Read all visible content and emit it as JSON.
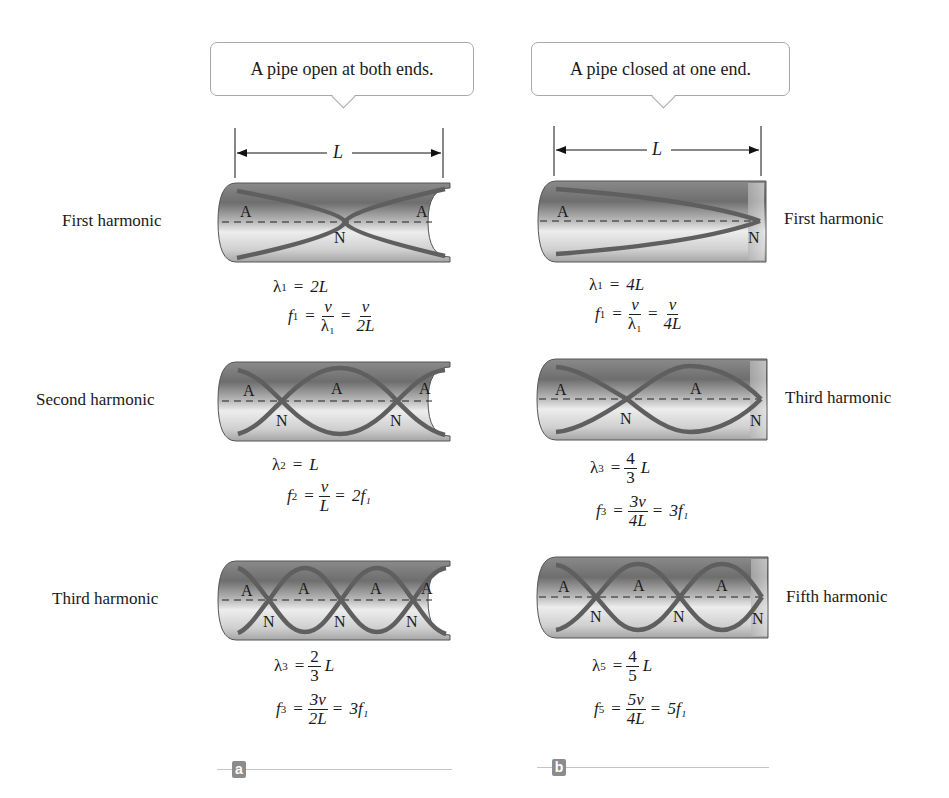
{
  "panels": [
    {
      "id": "a",
      "callout": "A pipe open at both ends.",
      "length_label": "L",
      "tag": "a",
      "harmonics": [
        {
          "label": "First harmonic",
          "wavelength": {
            "sym": "λ",
            "n": "1",
            "rhs": "2L"
          },
          "freq": {
            "sym": "f",
            "n": "1",
            "mid_num": "v",
            "mid_den": "λ₁",
            "rhs_num": "v",
            "rhs_den": "2L"
          },
          "nodes": [
            "A",
            "N",
            "A"
          ]
        },
        {
          "label": "Second harmonic",
          "wavelength": {
            "sym": "λ",
            "n": "2",
            "rhs": "L"
          },
          "freq": {
            "sym": "f",
            "n": "2",
            "mid_num": "v",
            "mid_den": "L",
            "rhs": "2f₁"
          },
          "nodes": [
            "A",
            "N",
            "A",
            "N",
            "A"
          ]
        },
        {
          "label": "Third harmonic",
          "wavelength": {
            "sym": "λ",
            "n": "3",
            "frac_num": "2",
            "frac_den": "3",
            "rhs": "L"
          },
          "freq": {
            "sym": "f",
            "n": "3",
            "mid_num": "3v",
            "mid_den": "2L",
            "rhs": "3f₁"
          },
          "nodes": [
            "A",
            "N",
            "A",
            "N",
            "A",
            "N",
            "A"
          ]
        }
      ]
    },
    {
      "id": "b",
      "callout": "A pipe closed at one end.",
      "length_label": "L",
      "tag": "b",
      "harmonics": [
        {
          "label": "First harmonic",
          "wavelength": {
            "sym": "λ",
            "n": "1",
            "rhs": "4L"
          },
          "freq": {
            "sym": "f",
            "n": "1",
            "mid_num": "v",
            "mid_den": "λ₁",
            "rhs_num": "v",
            "rhs_den": "4L"
          },
          "nodes": [
            "A",
            "N"
          ]
        },
        {
          "label": "Third harmonic",
          "wavelength": {
            "sym": "λ",
            "n": "3",
            "frac_num": "4",
            "frac_den": "3",
            "rhs": "L"
          },
          "freq": {
            "sym": "f",
            "n": "3",
            "mid_num": "3v",
            "mid_den": "4L",
            "rhs": "3f₁"
          },
          "nodes": [
            "A",
            "N",
            "A",
            "N"
          ]
        },
        {
          "label": "Fifth harmonic",
          "wavelength": {
            "sym": "λ",
            "n": "5",
            "frac_num": "4",
            "frac_den": "5",
            "rhs": "L"
          },
          "freq": {
            "sym": "f",
            "n": "5",
            "mid_num": "5v",
            "mid_den": "4L",
            "rhs": "5f₁"
          },
          "nodes": [
            "A",
            "N",
            "A",
            "N",
            "A",
            "N"
          ]
        }
      ]
    }
  ],
  "symbols": {
    "eq": "=",
    "antinode": "A",
    "node": "N"
  },
  "colors": {
    "wave": "#5f5f5f",
    "pipe_dark": "#6a6a6a",
    "pipe_light": "#e8e8e8",
    "callout_border": "#a8a8a8",
    "tag_bg": "#8c8c8c"
  }
}
